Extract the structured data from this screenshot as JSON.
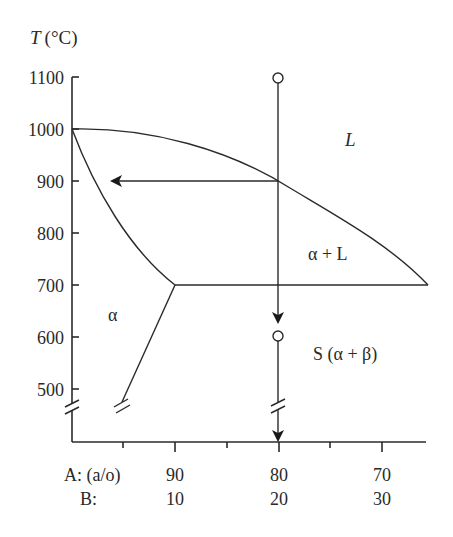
{
  "diagram": {
    "type": "binary-phase-diagram",
    "y_axis": {
      "title_var": "T",
      "title_unit": "(°C)",
      "ticks": [
        "1100",
        "1000",
        "900",
        "800",
        "700",
        "600",
        "500"
      ]
    },
    "x_axis": {
      "row_a_label": "A: (a/o)",
      "row_b_label": "B:",
      "row_a_ticks": [
        "90",
        "80",
        "70"
      ],
      "row_b_ticks": [
        "10",
        "20",
        "30"
      ]
    },
    "regions": {
      "liquid": "L",
      "alpha_plus_liquid": "α + L",
      "alpha": "α",
      "solid": "S (α + β)"
    },
    "annotations": {
      "cooling_path": "vertical cooling line at 80 a/o A from 1100 °C down through 600 °C",
      "tie_line": "horizontal arrow at 900 °C pointing to solidus"
    },
    "colors": {
      "line": "#2a2a2a",
      "background": "#ffffff"
    }
  }
}
